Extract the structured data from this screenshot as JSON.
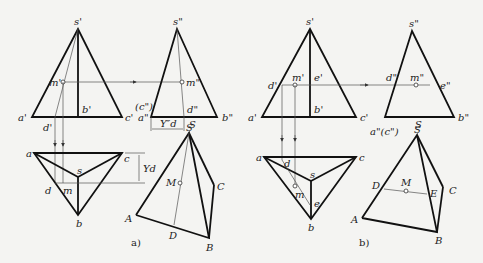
{
  "figure_a": {
    "caption": "a)",
    "front_view": {
      "apex": "s'",
      "left": "a'",
      "right": "c'",
      "mid": "b'",
      "point": "m'",
      "foot": "d'"
    },
    "side_view": {
      "apex": "s\"",
      "point": "m\"",
      "foot": "d\"",
      "hidden": "(c\")",
      "left": "a\"",
      "right": "b\"",
      "dim": "Y″d",
      "s_label": "S"
    },
    "top_view": {
      "a": "a",
      "b": "b",
      "c": "c",
      "s": "s",
      "d": "d",
      "m": "m",
      "dim": "Yd"
    },
    "pictorial": {
      "S": "S",
      "A": "A",
      "B": "B",
      "C": "C",
      "D": "D",
      "M": "M"
    }
  },
  "figure_b": {
    "caption": "b)",
    "front_view": {
      "apex": "s'",
      "left": "a'",
      "right": "c'",
      "mid": "b'",
      "point": "m'",
      "d": "d'",
      "e": "e'"
    },
    "side_view": {
      "apex": "s\"",
      "point": "m\"",
      "d": "d\"",
      "e": "e\"",
      "left": "a\"(c\")",
      "right": "b\"",
      "s_label": "S"
    },
    "top_view": {
      "a": "a",
      "b": "b",
      "c": "c",
      "s": "s",
      "d": "d",
      "m": "m",
      "e": "e"
    },
    "pictorial": {
      "S": "S",
      "A": "A",
      "B": "B",
      "C": "C",
      "D": "D",
      "E": "E",
      "M": "M"
    }
  }
}
